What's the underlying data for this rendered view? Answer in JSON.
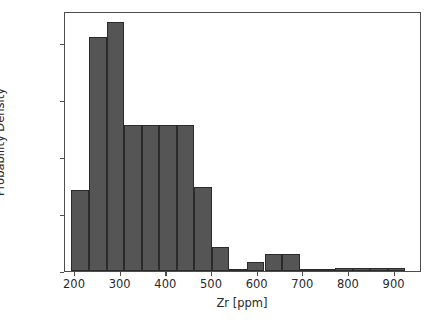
{
  "chart_data": {
    "type": "bar",
    "subtype": "histogram",
    "title": "",
    "xlabel": "Zr [ppm]",
    "ylabel": "Probability Density",
    "xlim": [
      178,
      960
    ],
    "ylim": [
      0.0,
      0.00456
    ],
    "grid": false,
    "legend": null,
    "bar_color": "#555555",
    "bar_edge_color": "#2b2b2b",
    "axis_color": "#4d4d4d",
    "text_color": "#2a2a2a",
    "xticks": [
      200,
      300,
      400,
      500,
      600,
      700,
      800,
      900
    ],
    "xtick_labels": [
      "200",
      "300",
      "400",
      "500",
      "600",
      "700",
      "800",
      "900"
    ],
    "yticks": [
      0.0,
      0.001,
      0.002,
      0.003,
      0.004
    ],
    "ytick_labels": [
      "0.000",
      "0.001",
      "0.002",
      "0.003",
      "0.004"
    ],
    "bin_edges": [
      192,
      230,
      269,
      307,
      346,
      384,
      423,
      461,
      500,
      538,
      577,
      615,
      654,
      692,
      731,
      769,
      808,
      846,
      885,
      923
    ],
    "values": [
      0.00142,
      0.0041,
      0.00437,
      0.00256,
      0.00256,
      0.00256,
      0.00256,
      0.00148,
      0.00042,
      3e-05,
      0.00016,
      0.00029,
      0.00029,
      0.0,
      0.0,
      5e-05,
      5e-05,
      5e-05,
      5e-05
    ],
    "bins": [
      {
        "range": "192-230",
        "center": 211,
        "density": 0.00142
      },
      {
        "range": "230-269",
        "center": 250,
        "density": 0.0041
      },
      {
        "range": "269-307",
        "center": 288,
        "density": 0.00437
      },
      {
        "range": "307-346",
        "center": 327,
        "density": 0.00256
      },
      {
        "range": "346-384",
        "center": 365,
        "density": 0.00256
      },
      {
        "range": "384-423",
        "center": 404,
        "density": 0.00256
      },
      {
        "range": "423-461",
        "center": 442,
        "density": 0.00256
      },
      {
        "range": "461-500",
        "center": 481,
        "density": 0.00148
      },
      {
        "range": "500-538",
        "center": 519,
        "density": 0.00042
      },
      {
        "range": "538-577",
        "center": 558,
        "density": 3e-05
      },
      {
        "range": "577-615",
        "center": 596,
        "density": 0.00016
      },
      {
        "range": "615-654",
        "center": 635,
        "density": 0.00029
      },
      {
        "range": "654-692",
        "center": 673,
        "density": 0.00029
      },
      {
        "range": "692-731",
        "center": 712,
        "density": 0.0
      },
      {
        "range": "731-769",
        "center": 750,
        "density": 0.0
      },
      {
        "range": "769-808",
        "center": 789,
        "density": 5e-05
      },
      {
        "range": "808-846",
        "center": 827,
        "density": 5e-05
      },
      {
        "range": "846-885",
        "center": 866,
        "density": 5e-05
      },
      {
        "range": "885-923",
        "center": 904,
        "density": 5e-05
      }
    ]
  }
}
